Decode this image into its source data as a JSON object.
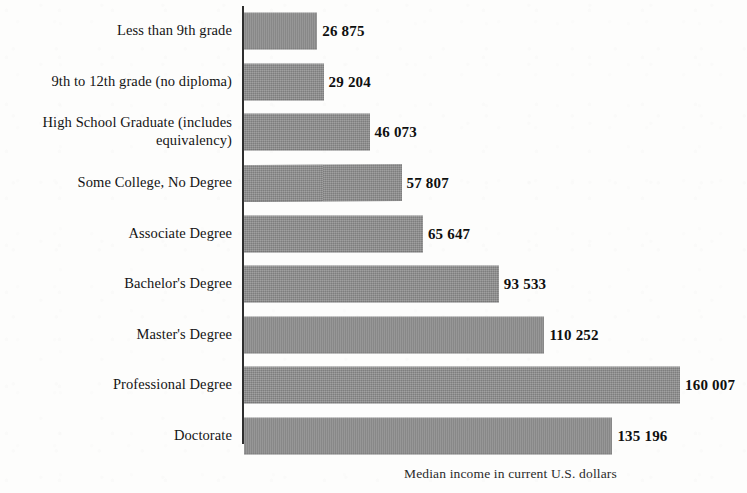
{
  "chart_data": {
    "type": "bar",
    "orientation": "horizontal",
    "title": "",
    "xlabel": "Median income in current U.S. dollars",
    "ylabel": "",
    "grid": false,
    "legend": false,
    "value_separator": "space",
    "xlim": [
      0,
      160007
    ],
    "categories": [
      "Less than 9th grade",
      "9th to 12th grade (no diploma)",
      "High School Graduate (includes equivalency)",
      "Some College, No Degree",
      "Associate Degree",
      "Bachelor's Degree",
      "Master's Degree",
      "Professional Degree",
      "Doctorate"
    ],
    "values": [
      26875,
      29204,
      46073,
      57807,
      65647,
      93533,
      110252,
      160007,
      135196
    ],
    "value_labels": [
      "26 875",
      "29 204",
      "46 073",
      "57 807",
      "65 647",
      "93 533",
      "110 252",
      "160 007",
      "135 196"
    ],
    "bar_color": "#8c8c8c",
    "axis_color": "#2e2e2e",
    "background_color": "#fdfdfc"
  },
  "bars": [
    {
      "label": "Less than 9th grade",
      "label_line2": "",
      "value_label": "26 875",
      "value": 26875
    },
    {
      "label": "9th to 12th grade (no diploma)",
      "label_line2": "",
      "value_label": "29 204",
      "value": 29204
    },
    {
      "label": "High School Graduate (includes",
      "label_line2": "equivalency)",
      "value_label": "46 073",
      "value": 46073
    },
    {
      "label": "Some College, No Degree",
      "label_line2": "",
      "value_label": "57 807",
      "value": 57807
    },
    {
      "label": "Associate Degree",
      "label_line2": "",
      "value_label": "65 647",
      "value": 65647
    },
    {
      "label": "Bachelor's Degree",
      "label_line2": "",
      "value_label": "93 533",
      "value": 93533
    },
    {
      "label": "Master's Degree",
      "label_line2": "",
      "value_label": "110 252",
      "value": 110252
    },
    {
      "label": "Professional Degree",
      "label_line2": "",
      "value_label": "160 007",
      "value": 160007
    },
    {
      "label": "Doctorate",
      "label_line2": "",
      "value_label": "135 196",
      "value": 135196
    }
  ],
  "axis": {
    "caption": "Median income in current U.S. dollars"
  }
}
